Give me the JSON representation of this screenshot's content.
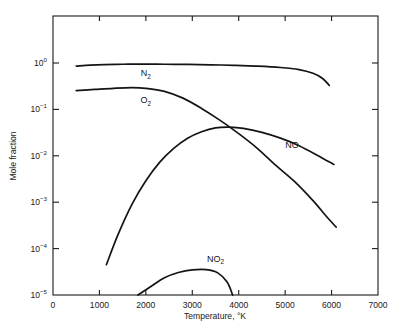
{
  "chart_data": {
    "type": "line",
    "title": "",
    "xlabel": "Temperature, °K",
    "ylabel": "Mole fraction",
    "xlim": [
      0,
      7000
    ],
    "ylim": [
      1e-05,
      2.0
    ],
    "yscale": "log",
    "grid": false,
    "legend": "inline-labels",
    "xticks": [
      0,
      1000,
      2000,
      3000,
      4000,
      5000,
      6000,
      7000
    ],
    "xticklabels": [
      "0",
      "1000",
      "2000",
      "3000",
      "4000",
      "5000",
      "6000",
      "7000"
    ],
    "yticks": [
      1e-05,
      0.0001,
      0.001,
      0.01,
      0.1,
      1
    ],
    "yticklabels": [
      "10−5",
      "10−4",
      "10−3",
      "10−2",
      "10−1",
      "10⁰"
    ],
    "ytick_mantissa": "10",
    "ytick_exponents": [
      "-5",
      "-4",
      "-3",
      "-2",
      "-1",
      "0"
    ],
    "series": [
      {
        "name": "N2",
        "label_text": "N",
        "label_sub": "2",
        "label_x": 2000,
        "label_y": 0.52,
        "points": [
          [
            500,
            0.86
          ],
          [
            800,
            0.9
          ],
          [
            1100,
            0.925
          ],
          [
            1500,
            0.94
          ],
          [
            1900,
            0.945
          ],
          [
            2400,
            0.94
          ],
          [
            2900,
            0.93
          ],
          [
            3400,
            0.915
          ],
          [
            3900,
            0.89
          ],
          [
            4400,
            0.855
          ],
          [
            4900,
            0.8
          ],
          [
            5300,
            0.72
          ],
          [
            5600,
            0.6
          ],
          [
            5800,
            0.47
          ],
          [
            5950,
            0.33
          ]
        ]
      },
      {
        "name": "O2",
        "label_text": "O",
        "label_sub": "2",
        "label_x": 2000,
        "label_y": 0.135,
        "points": [
          [
            500,
            0.255
          ],
          [
            900,
            0.27
          ],
          [
            1300,
            0.285
          ],
          [
            1700,
            0.295
          ],
          [
            2000,
            0.285
          ],
          [
            2400,
            0.245
          ],
          [
            2800,
            0.175
          ],
          [
            3200,
            0.105
          ],
          [
            3600,
            0.058
          ],
          [
            4000,
            0.03
          ],
          [
            4400,
            0.0145
          ],
          [
            4800,
            0.0062
          ],
          [
            5200,
            0.0028
          ],
          [
            5600,
            0.00108
          ],
          [
            5900,
            0.00048
          ],
          [
            6100,
            0.00029
          ]
        ]
      },
      {
        "name": "NO",
        "label_text": "NO",
        "label_sub": "",
        "label_x": 5150,
        "label_y": 0.0145,
        "points": [
          [
            1150,
            4.5e-05
          ],
          [
            1400,
            0.0002
          ],
          [
            1700,
            0.0009
          ],
          [
            2000,
            0.0029
          ],
          [
            2300,
            0.0073
          ],
          [
            2600,
            0.0145
          ],
          [
            2900,
            0.024
          ],
          [
            3200,
            0.033
          ],
          [
            3500,
            0.04
          ],
          [
            3800,
            0.0415
          ],
          [
            4100,
            0.039
          ],
          [
            4500,
            0.032
          ],
          [
            4900,
            0.024
          ],
          [
            5300,
            0.0165
          ],
          [
            5700,
            0.0102
          ],
          [
            6050,
            0.0065
          ]
        ]
      },
      {
        "name": "NO2",
        "label_text": "NO",
        "label_sub": "2",
        "label_x": 3500,
        "label_y": 5.2e-05,
        "points": [
          [
            1830,
            1e-05
          ],
          [
            2100,
            1.5e-05
          ],
          [
            2400,
            2.35e-05
          ],
          [
            2700,
            3.05e-05
          ],
          [
            3000,
            3.48e-05
          ],
          [
            3300,
            3.52e-05
          ],
          [
            3550,
            3e-05
          ],
          [
            3750,
            1.9e-05
          ],
          [
            3870,
            1e-05
          ]
        ]
      }
    ]
  },
  "axes": {
    "x_label": "Temperature, °K",
    "y_label": "Mole fraction"
  }
}
